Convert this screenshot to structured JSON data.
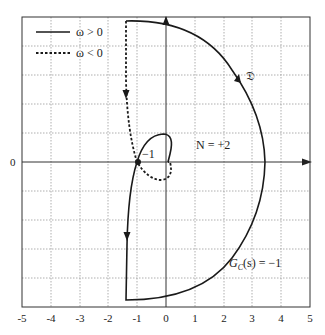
{
  "figure": {
    "type": "nyquist-diagram",
    "axes": {
      "x_ticks": [
        "-5",
        "-4",
        "-3",
        "-2",
        "-1",
        "0",
        "1",
        "2",
        "3",
        "4",
        "5"
      ],
      "y_tick_labeled": "0",
      "xlim": [
        -5,
        5
      ],
      "ylim": [
        -5,
        5
      ],
      "grid": "dotted"
    },
    "legend": {
      "items": [
        {
          "label": "ω > 0",
          "style": "solid"
        },
        {
          "label": "ω < 0",
          "style": "dashed"
        }
      ]
    },
    "annotations": {
      "critical_point": "−1",
      "contour_label": "𝔇",
      "encirclements": "N = +2",
      "controller": "G",
      "controller_sub": "C",
      "controller_rest": "(s) = −1"
    },
    "colors": {
      "curve": "#1a1a1a",
      "grid": "#9a9a9a",
      "frame": "#333333"
    }
  }
}
